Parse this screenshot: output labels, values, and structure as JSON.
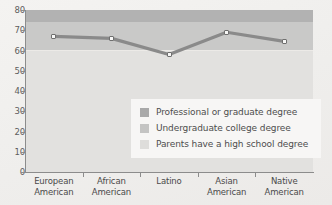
{
  "chart_data": {
    "type": "line",
    "title": "",
    "xlabel": "",
    "ylabel": "",
    "ylim": [
      0,
      80
    ],
    "grid": false,
    "legend_position": "inside-lower-right",
    "categories": [
      "European American",
      "African American",
      "Latino",
      "Asian American",
      "Native American"
    ],
    "category_lines": [
      [
        "European",
        "American"
      ],
      [
        "African",
        "American"
      ],
      [
        "Latino",
        ""
      ],
      [
        "Asian",
        "American"
      ],
      [
        "Native",
        "American"
      ]
    ],
    "series": [
      {
        "name": "percent",
        "values": [
          67,
          66,
          58,
          69,
          64.5
        ]
      }
    ],
    "y_ticks": [
      0,
      10,
      20,
      30,
      40,
      50,
      60,
      70,
      80
    ],
    "bands": [
      {
        "name": "Professional or graduate degree",
        "from": 74,
        "to": 80,
        "color": "#b2b2b2"
      },
      {
        "name": "Undergraduate college degree",
        "from": 60,
        "to": 74,
        "color": "#c9c9c8"
      },
      {
        "name": "Parents have a high school degree",
        "from": 0,
        "to": 60,
        "color": "#e2e1df"
      }
    ],
    "legend": [
      {
        "label": "Professional or graduate degree",
        "color": "#a9a9a9"
      },
      {
        "label": "Undergraduate college degree",
        "color": "#c4c4c3"
      },
      {
        "label": "Parents have a high school degree",
        "color": "#dedddb"
      }
    ],
    "line_color": "#8a8a8a",
    "marker_face_color": "#f7f7f6",
    "marker_edge_color": "#6f6f6f",
    "axis_color": "#8c8c8c",
    "background_color": "#f2f1ef"
  }
}
